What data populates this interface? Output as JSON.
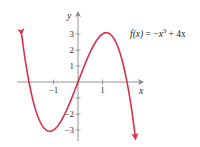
{
  "chart_data": {
    "type": "line",
    "title": "",
    "function_label": "f(x) = −x³ + 4x",
    "function_label_parts": {
      "lhs": "f(x)",
      "eq": " = −",
      "x": "x",
      "exp": "3",
      "rest": " + 4x"
    },
    "xlabel": "x",
    "ylabel": "y",
    "xlim": [
      -2.5,
      2.7
    ],
    "ylim": [
      -3.4,
      4.2
    ],
    "x_ticks": [
      -1,
      1
    ],
    "x_tick_labels": [
      "−1",
      "1"
    ],
    "y_ticks": [
      -3,
      -2,
      -1,
      1,
      2,
      3
    ],
    "y_tick_labels": [
      "−3",
      "−2",
      "",
      "1",
      "2",
      "3"
    ],
    "series": [
      {
        "name": "f(x) = -x^3 + 4x",
        "color": "#d9304a",
        "x": [
          -2.3,
          -2.0,
          -1.5,
          -1.155,
          -1.0,
          -0.5,
          0.0,
          0.5,
          1.0,
          1.155,
          1.5,
          2.0,
          2.35
        ],
        "y": [
          2.97,
          0.0,
          -2.63,
          -3.08,
          -3.0,
          -1.88,
          0.0,
          1.88,
          3.0,
          3.08,
          2.63,
          0.0,
          -3.58
        ]
      }
    ],
    "grid": false,
    "legend": "none"
  },
  "colors": {
    "curve": "#d9304a",
    "axis": "#888888",
    "text": "#333333"
  }
}
